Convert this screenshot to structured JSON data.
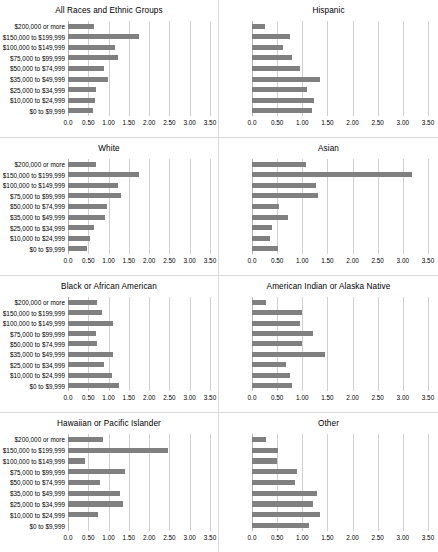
{
  "figure": {
    "categories": [
      "$200,000 or more",
      "$150,000 to $199,999",
      "$100,000 to $149,999",
      "$75,000 to $99,999",
      "$50,000 to $74,999",
      "$35,000 to $49,999",
      "$25,000 to $34,999",
      "$10,000 to $24,999",
      "$0 to $9,999"
    ],
    "xticks": [
      "0.0",
      "0.50",
      "1.00",
      "1.50",
      "2.00",
      "2.50",
      "3.00",
      "3.50"
    ],
    "xlim": [
      0,
      3.5
    ],
    "bar_color": "#808080",
    "gridline_color": "#d0d0d0",
    "panel_border_color": "#d9d9d9"
  },
  "chart_data": {
    "type": "bar",
    "title": "",
    "xlabel": "",
    "ylabel": "",
    "xlim": [
      0,
      3.5
    ],
    "grid": true,
    "legend": "none",
    "orientation": "horizontal",
    "categories": [
      "$200,000 or more",
      "$150,000 to $199,999",
      "$100,000 to $149,999",
      "$75,000 to $99,999",
      "$50,000 to $74,999",
      "$35,000 to $49,999",
      "$25,000 to $34,999",
      "$10,000 to $24,999",
      "$0 to $9,999"
    ],
    "tick_labels": [
      "0.0",
      "0.50",
      "1.00",
      "1.50",
      "2.00",
      "2.50",
      "3.00",
      "3.50"
    ],
    "panels": [
      {
        "title": "All Races and Ethnic Groups",
        "values": [
          0.64,
          1.74,
          1.17,
          1.24,
          0.88,
          0.98,
          0.7,
          0.66,
          0.62
        ]
      },
      {
        "title": "Hispanic",
        "values": [
          0.26,
          0.76,
          0.62,
          0.8,
          0.96,
          1.36,
          1.1,
          1.23,
          1.2
        ]
      },
      {
        "title": "White",
        "values": [
          0.68,
          1.76,
          1.23,
          1.3,
          0.95,
          0.91,
          0.63,
          0.55,
          0.47
        ]
      },
      {
        "title": "Asian",
        "values": [
          1.07,
          3.18,
          1.27,
          1.32,
          0.53,
          0.71,
          0.4,
          0.35,
          0.52
        ]
      },
      {
        "title": "Black or African American",
        "values": [
          0.72,
          0.83,
          1.1,
          0.7,
          0.71,
          1.1,
          0.88,
          1.08,
          1.25
        ]
      },
      {
        "title": "American Indian or Alaska Native",
        "values": [
          0.27,
          1.0,
          0.96,
          1.21,
          1.0,
          1.45,
          0.68,
          0.75,
          0.8
        ]
      },
      {
        "title": "Hawaiian or Pacific Islander",
        "values": [
          0.86,
          2.46,
          0.43,
          1.41,
          0.78,
          1.29,
          1.35,
          0.73,
          0.0
        ]
      },
      {
        "title": "Other",
        "values": [
          0.28,
          0.52,
          0.5,
          0.9,
          0.85,
          1.29,
          1.21,
          1.36,
          1.13
        ]
      }
    ]
  }
}
